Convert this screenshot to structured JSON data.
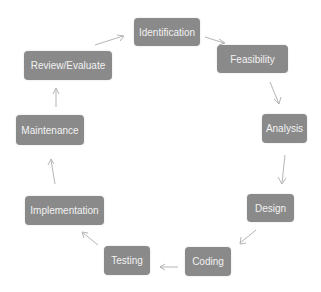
{
  "diagram": {
    "type": "cycle",
    "nodes": [
      {
        "id": "identification",
        "label": "Identification"
      },
      {
        "id": "feasibility",
        "label": "Feasibility"
      },
      {
        "id": "analysis",
        "label": "Analysis"
      },
      {
        "id": "design",
        "label": "Design"
      },
      {
        "id": "coding",
        "label": "Coding"
      },
      {
        "id": "testing",
        "label": "Testing"
      },
      {
        "id": "implementation",
        "label": "Implementation"
      },
      {
        "id": "maintenance",
        "label": "Maintenance"
      },
      {
        "id": "review",
        "label": "Review/Evaluate"
      }
    ],
    "edges": [
      [
        "identification",
        "feasibility"
      ],
      [
        "feasibility",
        "analysis"
      ],
      [
        "analysis",
        "design"
      ],
      [
        "design",
        "coding"
      ],
      [
        "coding",
        "testing"
      ],
      [
        "testing",
        "implementation"
      ],
      [
        "implementation",
        "maintenance"
      ],
      [
        "maintenance",
        "review"
      ],
      [
        "review",
        "identification"
      ]
    ],
    "colors": {
      "node_fill": "#8a8a8a",
      "node_text": "#f2f2f2",
      "arrow": "#b5b5b5"
    }
  }
}
